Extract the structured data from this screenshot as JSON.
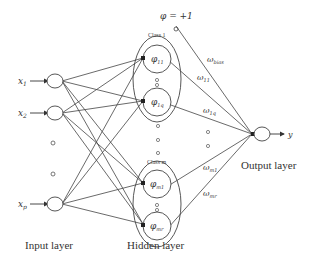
{
  "diagram": {
    "type": "RBF neural network architecture",
    "bias_label": "φ = +1",
    "inputs": [
      {
        "label": "x",
        "sub": "1"
      },
      {
        "label": "x",
        "sub": "2"
      },
      {
        "label": "x",
        "sub": "p"
      }
    ],
    "classes": [
      {
        "label": "Class 1",
        "nodes": [
          {
            "label": "φ",
            "sub": "11"
          },
          {
            "label": "φ",
            "sub": "1q"
          }
        ]
      },
      {
        "label": "Class m",
        "nodes": [
          {
            "label": "φ",
            "sub": "m1"
          },
          {
            "label": "φ",
            "sub": "mr"
          }
        ]
      }
    ],
    "weights": [
      {
        "label": "ω",
        "sub": "bias"
      },
      {
        "label": "ω",
        "sub": "11"
      },
      {
        "label": "ω",
        "sub": "1q"
      },
      {
        "label": "ω",
        "sub": "m1"
      },
      {
        "label": "ω",
        "sub": "mr"
      }
    ],
    "output": {
      "label": "y"
    },
    "layers": {
      "input": "Input layer",
      "hidden": "Hidden layer",
      "output": "Output layer"
    }
  }
}
